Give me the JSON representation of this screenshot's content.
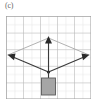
{
  "figure": {
    "panel_label": "(c)",
    "caption_text": "",
    "type": "force-vector-diagram"
  },
  "grid": {
    "columns": 10,
    "rows": 10,
    "cell_size_px": 8.5,
    "minor_line_color": "#d8d8d8",
    "major_line_color": "#b4b4b4",
    "border_color": "#9a9a9a",
    "background_color": "#ffffff",
    "major_every": 2
  },
  "diagram": {
    "junction_point": {
      "x": 42.5,
      "y": 56,
      "label": "knot"
    },
    "vectors": [
      {
        "name": "tension-left",
        "from": {
          "x": 42.5,
          "y": 56
        },
        "to": {
          "x": 2,
          "y": 39
        },
        "arrowhead": "left",
        "color": "#3a3a3a",
        "width": 1.1,
        "style": "solid"
      },
      {
        "name": "tension-right",
        "from": {
          "x": 42.5,
          "y": 56
        },
        "to": {
          "x": 83,
          "y": 39
        },
        "arrowhead": "right",
        "color": "#3a3a3a",
        "width": 1.1,
        "style": "solid"
      },
      {
        "name": "resultant-up",
        "from": {
          "x": 42.5,
          "y": 56
        },
        "to": {
          "x": 42.5,
          "y": 22
        },
        "arrowhead": "up",
        "color": "#3a3a3a",
        "width": 1.1,
        "style": "solid"
      },
      {
        "name": "component-left-upper",
        "from": {
          "x": 2,
          "y": 39
        },
        "to": {
          "x": 42.5,
          "y": 22
        },
        "arrowhead": "none",
        "color": "#a8a8a8",
        "width": 0.9,
        "style": "solid"
      },
      {
        "name": "component-right-upper",
        "from": {
          "x": 83,
          "y": 39
        },
        "to": {
          "x": 42.5,
          "y": 22
        },
        "arrowhead": "none",
        "color": "#a8a8a8",
        "width": 0.9,
        "style": "solid"
      }
    ],
    "hanging_block": {
      "name": "block",
      "x": 35.5,
      "y": 62,
      "width": 14,
      "height": 17,
      "fill_color": "#a6a6a6",
      "stroke_color": "#5a5a5a"
    },
    "string": {
      "from": {
        "x": 42.5,
        "y": 56
      },
      "to": {
        "x": 42.5,
        "y": 62
      },
      "color": "#3a3a3a"
    }
  },
  "colors": {
    "vector_dark": "#3a3a3a",
    "vector_light": "#a8a8a8",
    "block_fill": "#a6a6a6",
    "grid_line": "#d8d8d8",
    "label_text": "#6b6b6b"
  }
}
